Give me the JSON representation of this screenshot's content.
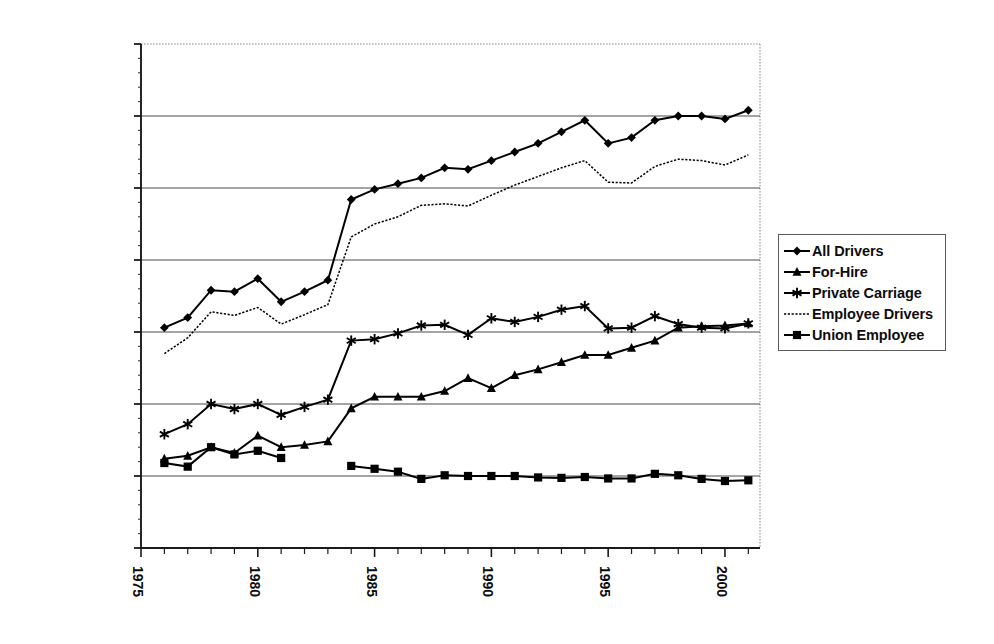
{
  "chart_data": {
    "type": "line",
    "title": "",
    "xlabel": "",
    "ylabel": "",
    "xlim": [
      1975,
      2001.5
    ],
    "ylim": [
      0,
      3500000
    ],
    "grid": true,
    "legend_position": "right",
    "y_ticks": [
      "0",
      "500,000",
      "1,000,000",
      "1,500,000",
      "2,000,000",
      "2,500,000",
      "3,000,000",
      "3,500,000"
    ],
    "y_tick_values": [
      0,
      500000,
      1000000,
      1500000,
      2000000,
      2500000,
      3000000,
      3500000
    ],
    "x_ticks": [
      "1975",
      "1980",
      "1985",
      "1990",
      "1995",
      "2000"
    ],
    "x_tick_values": [
      1975,
      1980,
      1985,
      1990,
      1995,
      2000
    ],
    "x": [
      1976,
      1977,
      1978,
      1979,
      1980,
      1981,
      1982,
      1983,
      1984,
      1985,
      1986,
      1987,
      1988,
      1989,
      1990,
      1991,
      1992,
      1993,
      1994,
      1995,
      1996,
      1997,
      1998,
      1999,
      2000,
      2001
    ],
    "series": [
      {
        "name": "All Drivers",
        "marker": "diamond",
        "line": "solid",
        "values": [
          1530000,
          1600000,
          1790000,
          1780000,
          1870000,
          1710000,
          1780000,
          1860000,
          2420000,
          2490000,
          2530000,
          2570000,
          2640000,
          2630000,
          2690000,
          2750000,
          2810000,
          2890000,
          2970000,
          2810000,
          2850000,
          2970000,
          3000000,
          3000000,
          2980000,
          3040000
        ]
      },
      {
        "name": "For-Hire",
        "marker": "triangle",
        "line": "solid",
        "values": [
          620000,
          640000,
          700000,
          660000,
          780000,
          700000,
          715000,
          740000,
          970000,
          1050000,
          1050000,
          1050000,
          1090000,
          1180000,
          1110000,
          1200000,
          1240000,
          1290000,
          1340000,
          1340000,
          1390000,
          1440000,
          1530000,
          1540000,
          1545000,
          1560000
        ]
      },
      {
        "name": "Private Carriage",
        "marker": "star",
        "line": "solid",
        "values": [
          790000,
          860000,
          1000000,
          965000,
          1000000,
          925000,
          980000,
          1030000,
          1440000,
          1450000,
          1490000,
          1545000,
          1550000,
          1480000,
          1595000,
          1570000,
          1605000,
          1655000,
          1680000,
          1525000,
          1530000,
          1610000,
          1555000,
          1530000,
          1525000,
          1560000
        ]
      },
      {
        "name": "Employee Drivers",
        "marker": "none",
        "line": "dotted",
        "values": [
          1350000,
          1460000,
          1640000,
          1615000,
          1670000,
          1555000,
          1620000,
          1690000,
          2160000,
          2250000,
          2300000,
          2380000,
          2390000,
          2375000,
          2450000,
          2520000,
          2580000,
          2640000,
          2690000,
          2540000,
          2535000,
          2650000,
          2700000,
          2690000,
          2660000,
          2730000
        ]
      },
      {
        "name": "Union  Employee",
        "marker": "square",
        "line": "solid",
        "values": [
          590000,
          565000,
          700000,
          650000,
          675000,
          625000,
          null,
          null,
          570000,
          550000,
          530000,
          480000,
          505000,
          500000,
          500000,
          500000,
          490000,
          487000,
          493000,
          483000,
          483000,
          515000,
          505000,
          480000,
          465000,
          470000
        ]
      }
    ]
  },
  "legend": {
    "items": [
      {
        "label": "All Drivers"
      },
      {
        "label": "For-Hire"
      },
      {
        "label": "Private Carriage"
      },
      {
        "label": "Employee Drivers"
      },
      {
        "label": "Union  Employee"
      }
    ]
  }
}
